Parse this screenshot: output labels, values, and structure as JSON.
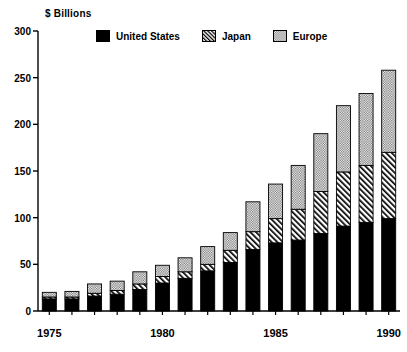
{
  "chart_data": {
    "type": "bar",
    "subtype": "stacked-bar",
    "title": "",
    "xlabel": "",
    "ylabel": "$ Billions",
    "ylim": [
      0,
      300
    ],
    "yticks": [
      0,
      50,
      100,
      150,
      200,
      250,
      300
    ],
    "ytick_labels": [
      "0",
      "50",
      "100",
      "150",
      "200",
      "250",
      "300"
    ],
    "grid": false,
    "legend_position": "top",
    "categories": [
      "1975",
      "1976",
      "1977",
      "1978",
      "1979",
      "1980",
      "1981",
      "1982",
      "1983",
      "1984",
      "1985",
      "1986",
      "1987",
      "1988",
      "1989",
      "1990"
    ],
    "xtick_labels_shown": [
      "1975",
      "1980",
      "1985",
      "1990"
    ],
    "series": [
      {
        "name": "United States",
        "pattern": "solid",
        "color": "#000000",
        "values": [
          13,
          13,
          16,
          18,
          23,
          30,
          35,
          43,
          52,
          66,
          73,
          76,
          83,
          91,
          95,
          99
        ]
      },
      {
        "name": "Japan",
        "pattern": "diagonal-hatch",
        "color": "#ffffff",
        "values": [
          2,
          2,
          3,
          4,
          6,
          7,
          7,
          7,
          13,
          19,
          26,
          33,
          45,
          58,
          61,
          71
        ]
      },
      {
        "name": "Europe",
        "pattern": "stipple-dots",
        "color": "#ffffff",
        "values": [
          5,
          6,
          10,
          10,
          13,
          12,
          15,
          19,
          19,
          32,
          37,
          47,
          62,
          71,
          77,
          88
        ]
      }
    ],
    "totals": [
      20,
      21,
      29,
      32,
      42,
      49,
      57,
      69,
      84,
      117,
      136,
      156,
      190,
      220,
      233,
      258
    ]
  },
  "legend": {
    "entries": [
      {
        "label": "United States",
        "swatch": "solid-black-swatch"
      },
      {
        "label": "Japan",
        "swatch": "diagonal-hatch-swatch"
      },
      {
        "label": "Europe",
        "swatch": "stipple-dot-swatch"
      }
    ]
  }
}
